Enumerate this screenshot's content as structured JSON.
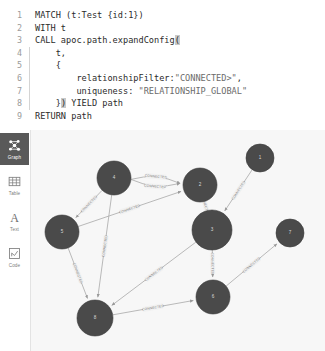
{
  "editor": {
    "lines": [
      {
        "n": "1",
        "indent": false,
        "segments": [
          {
            "t": "MATCH (t:Test {id:1})",
            "k": "plain"
          }
        ]
      },
      {
        "n": "2",
        "indent": false,
        "segments": [
          {
            "t": "WITH t",
            "k": "plain"
          }
        ]
      },
      {
        "n": "3",
        "indent": false,
        "segments": [
          {
            "t": "CALL apoc.path.expandConfig",
            "k": "plain"
          },
          {
            "t": "(",
            "k": "hl"
          }
        ]
      },
      {
        "n": "4",
        "indent": true,
        "segments": [
          {
            "t": "    t,",
            "k": "plain"
          }
        ]
      },
      {
        "n": "5",
        "indent": true,
        "segments": [
          {
            "t": "    {",
            "k": "plain"
          }
        ]
      },
      {
        "n": "6",
        "indent": true,
        "segments": [
          {
            "t": "        relationshipFilter:",
            "k": "plain"
          },
          {
            "t": "\"CONNECTED>\"",
            "k": "str"
          },
          {
            "t": ",",
            "k": "plain"
          }
        ]
      },
      {
        "n": "7",
        "indent": true,
        "segments": [
          {
            "t": "        uniqueness: ",
            "k": "plain"
          },
          {
            "t": "\"RELATIONSHIP_GLOBAL\"",
            "k": "str"
          }
        ]
      },
      {
        "n": "8",
        "indent": true,
        "segments": [
          {
            "t": "    }",
            "k": "plain"
          },
          {
            "t": ")",
            "k": "hl"
          },
          {
            "t": " YIELD path",
            "k": "plain"
          }
        ]
      },
      {
        "n": "9",
        "indent": false,
        "segments": [
          {
            "t": "RETURN path",
            "k": "plain"
          }
        ]
      }
    ]
  },
  "sidebar": {
    "items": [
      {
        "label": "Graph",
        "icon": "graph-icon",
        "active": true
      },
      {
        "label": "Table",
        "icon": "table-icon",
        "active": false
      },
      {
        "label": "Text",
        "icon": "text-icon",
        "active": false
      },
      {
        "label": "Code",
        "icon": "code-icon",
        "active": false
      }
    ]
  },
  "graph": {
    "edge_label": "CONNECTED",
    "node_color": "#4a4a4a",
    "edge_color": "#a8a8a8",
    "background": "#f7f7f7",
    "nodes": [
      {
        "id": "n4",
        "label": "4",
        "x": 83,
        "y": 48,
        "r": 17
      },
      {
        "id": "n2",
        "label": "2",
        "x": 169,
        "y": 55,
        "r": 17
      },
      {
        "id": "n1",
        "label": "1",
        "x": 229,
        "y": 28,
        "r": 14
      },
      {
        "id": "n3",
        "label": "3",
        "x": 181,
        "y": 100,
        "r": 20
      },
      {
        "id": "n5",
        "label": "5",
        "x": 31,
        "y": 102,
        "r": 17
      },
      {
        "id": "n7",
        "label": "7",
        "x": 259,
        "y": 103,
        "r": 14
      },
      {
        "id": "n6",
        "label": "6",
        "x": 182,
        "y": 167,
        "r": 17
      },
      {
        "id": "n8",
        "label": "8",
        "x": 64,
        "y": 188,
        "r": 18
      }
    ],
    "edges": [
      {
        "from": "n4",
        "to": "n2",
        "curve": -9,
        "label": "CONNECTED"
      },
      {
        "from": "n4",
        "to": "n2",
        "curve": 9,
        "label": "CONNECTED"
      },
      {
        "from": "n4",
        "to": "n5",
        "curve": 0,
        "label": "CONNECTED"
      },
      {
        "from": "n5",
        "to": "n2",
        "curve": 0,
        "label": "CONNECTED"
      },
      {
        "from": "n4",
        "to": "n8",
        "curve": 0,
        "label": "CONNECTED"
      },
      {
        "from": "n5",
        "to": "n8",
        "curve": 0,
        "label": "CONNECTED"
      },
      {
        "from": "n1",
        "to": "n3",
        "curve": 0,
        "label": "CONNECTED"
      },
      {
        "from": "n2",
        "to": "n3",
        "curve": 0,
        "label": "CONNECTED"
      },
      {
        "from": "n3",
        "to": "n8",
        "curve": 0,
        "label": "CONNECTED"
      },
      {
        "from": "n3",
        "to": "n6",
        "curve": 0,
        "label": "CONNECTED"
      },
      {
        "from": "n6",
        "to": "n7",
        "curve": 0,
        "label": "CONNECTED"
      },
      {
        "from": "n8",
        "to": "n6",
        "curve": 0,
        "label": "CONNECTED"
      }
    ]
  }
}
